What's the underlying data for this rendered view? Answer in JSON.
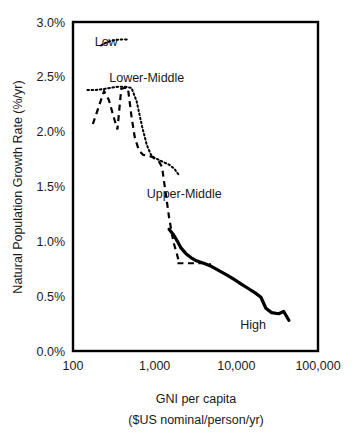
{
  "chart_data": {
    "type": "line",
    "title": "",
    "xlabel": "GNI per capita ($US nominal/person/yr)",
    "xlabel_line1": "GNI per capita",
    "xlabel_line2": "($US nominal/person/yr)",
    "ylabel": "Natural Population Growth Rate (%/yr)",
    "xscale": "log",
    "xlim": [
      100,
      100000
    ],
    "ylim": [
      0.0,
      3.0
    ],
    "ytick_labels": [
      "0.0%",
      "0.5%",
      "1.0%",
      "1.5%",
      "2.0%",
      "2.5%",
      "3.0%"
    ],
    "ytick_values": [
      0.0,
      0.5,
      1.0,
      1.5,
      2.0,
      2.5,
      3.0
    ],
    "xtick_labels": [
      "100",
      "1,000",
      "10,000",
      "100,000"
    ],
    "xtick_values": [
      100,
      1000,
      10000,
      100000
    ],
    "grid": false,
    "legend_position": "inline-annotations",
    "series": [
      {
        "name": "Low",
        "label": "Low",
        "style": "dotted",
        "color": "#000000",
        "label_x": 255,
        "label_y": 2.82,
        "points": [
          [
            150,
            2.38
          ],
          [
            190,
            2.38
          ],
          [
            240,
            2.39
          ],
          [
            290,
            2.4
          ],
          [
            360,
            2.41
          ],
          [
            430,
            2.41
          ],
          [
            520,
            2.4
          ],
          [
            600,
            2.28
          ],
          [
            700,
            2.05
          ],
          [
            800,
            1.88
          ],
          [
            900,
            1.79
          ],
          [
            1000,
            1.76
          ],
          [
            1150,
            1.74
          ],
          [
            1300,
            1.72
          ],
          [
            1500,
            1.7
          ],
          [
            1750,
            1.66
          ],
          [
            2000,
            1.6
          ]
        ]
      },
      {
        "name": "Lower-Middle",
        "label": "Lower-Middle",
        "style": "dashed",
        "color": "#000000",
        "label_x": 800,
        "label_y": 2.49,
        "points": [
          [
            175,
            2.07
          ],
          [
            205,
            2.22
          ],
          [
            240,
            2.37
          ],
          [
            275,
            2.29
          ],
          [
            310,
            2.15
          ],
          [
            350,
            2.02
          ],
          [
            390,
            2.39
          ],
          [
            430,
            2.4
          ],
          [
            470,
            2.4
          ],
          [
            520,
            2.14
          ],
          [
            570,
            1.95
          ],
          [
            640,
            1.83
          ],
          [
            720,
            1.79
          ],
          [
            820,
            1.78
          ],
          [
            930,
            1.77
          ],
          [
            1020,
            1.75
          ],
          [
            1120,
            1.73
          ],
          [
            1230,
            1.68
          ],
          [
            1300,
            1.55
          ],
          [
            1400,
            1.38
          ],
          [
            1500,
            1.22
          ],
          [
            1600,
            1.1
          ],
          [
            1700,
            0.99
          ],
          [
            1850,
            0.9
          ],
          [
            2000,
            0.8
          ]
        ]
      },
      {
        "name": "Upper-Middle",
        "label": "Upper-Middle",
        "style": "dashed",
        "color": "#000000",
        "label_x": 2300,
        "label_y": 1.44,
        "points": [
          [
            1900,
            0.8
          ],
          [
            2200,
            0.8
          ],
          [
            2600,
            0.8
          ],
          [
            3000,
            0.8
          ],
          [
            3400,
            0.8
          ],
          [
            3900,
            0.8
          ],
          [
            4400,
            0.79
          ],
          [
            4900,
            0.79
          ]
        ]
      },
      {
        "name": "High",
        "label": "High",
        "style": "solid",
        "color": "#000000",
        "label_x": 16000,
        "label_y": 0.24,
        "points": [
          [
            1500,
            1.11
          ],
          [
            1700,
            1.06
          ],
          [
            1900,
            1.0
          ],
          [
            2100,
            0.94
          ],
          [
            2400,
            0.89
          ],
          [
            2800,
            0.85
          ],
          [
            3300,
            0.82
          ],
          [
            4000,
            0.8
          ],
          [
            5000,
            0.77
          ],
          [
            6200,
            0.73
          ],
          [
            7800,
            0.69
          ],
          [
            9500,
            0.65
          ],
          [
            11500,
            0.61
          ],
          [
            14000,
            0.57
          ],
          [
            17000,
            0.53
          ],
          [
            20000,
            0.49
          ],
          [
            23000,
            0.39
          ],
          [
            27000,
            0.35
          ],
          [
            33000,
            0.34
          ],
          [
            38000,
            0.36
          ],
          [
            44000,
            0.28
          ]
        ]
      }
    ]
  },
  "figure": {
    "background_color": "#ffffff",
    "line_color": "#000000"
  }
}
